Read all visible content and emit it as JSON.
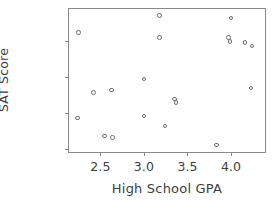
{
  "chart_data": {
    "type": "scatter",
    "title": "",
    "xlabel": "High School GPA",
    "ylabel": "SAT Score",
    "xlim": [
      2.14,
      4.39
    ],
    "ylim": [
      785,
      1580
    ],
    "xticks": [
      2.5,
      3.0,
      3.5,
      4.0
    ],
    "xtick_labels": [
      "2.5",
      "3.0",
      "3.5",
      "4.0"
    ],
    "yticks": [
      800,
      1000,
      1200,
      1400
    ],
    "ytick_labels": [
      "800",
      "1000",
      "1200",
      "1400"
    ],
    "grid": false,
    "legend": null,
    "marker": {
      "shape": "open-circle",
      "edge_color": "#6f6f6f",
      "fill_color": "none",
      "size_px": 4.6
    },
    "frame_color": "#8a8a8a",
    "n_points": 20,
    "points": [
      {
        "x": 2.25,
        "y": 1450
      },
      {
        "x": 2.24,
        "y": 975
      },
      {
        "x": 2.42,
        "y": 1115
      },
      {
        "x": 2.63,
        "y": 1130
      },
      {
        "x": 2.55,
        "y": 875
      },
      {
        "x": 2.64,
        "y": 865
      },
      {
        "x": 3.0,
        "y": 1190
      },
      {
        "x": 3.0,
        "y": 985
      },
      {
        "x": 3.18,
        "y": 1545
      },
      {
        "x": 3.18,
        "y": 1420
      },
      {
        "x": 3.24,
        "y": 930
      },
      {
        "x": 3.35,
        "y": 1080
      },
      {
        "x": 3.37,
        "y": 1060
      },
      {
        "x": 3.83,
        "y": 825
      },
      {
        "x": 4.0,
        "y": 1530
      },
      {
        "x": 3.97,
        "y": 1420
      },
      {
        "x": 3.99,
        "y": 1400
      },
      {
        "x": 4.16,
        "y": 1395
      },
      {
        "x": 4.24,
        "y": 1375
      },
      {
        "x": 4.23,
        "y": 1140
      }
    ],
    "x": [
      2.25,
      2.24,
      2.42,
      2.63,
      2.55,
      2.64,
      3.0,
      3.0,
      3.18,
      3.18,
      3.24,
      3.35,
      3.37,
      3.83,
      4.0,
      3.97,
      3.99,
      4.16,
      4.24,
      4.23
    ],
    "y": [
      1450,
      975,
      1115,
      1130,
      875,
      865,
      1190,
      985,
      1545,
      1420,
      930,
      1080,
      1060,
      825,
      1530,
      1420,
      1400,
      1395,
      1375,
      1140
    ]
  }
}
